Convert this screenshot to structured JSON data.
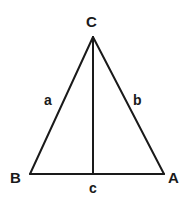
{
  "figure": {
    "type": "geometry-diagram",
    "shape": "triangle-with-altitude",
    "background_color": "#ffffff",
    "stroke_color": "#1a1a1a",
    "label_color": "#1a1a1a"
  },
  "vertices": {
    "apex": {
      "label": "C",
      "x": 93,
      "y": 37
    },
    "bottom_left": {
      "label": "B",
      "x": 30,
      "y": 174
    },
    "bottom_right": {
      "label": "A",
      "x": 164,
      "y": 174
    },
    "foot_of_altitude": {
      "x": 93,
      "y": 174
    }
  },
  "sides": {
    "left": {
      "label": "a",
      "from": "C",
      "to": "B"
    },
    "right": {
      "label": "b",
      "from": "C",
      "to": "A"
    },
    "base": {
      "label": "c",
      "from": "B",
      "to": "A"
    }
  },
  "altitude": {
    "from": "C",
    "to": "foot_of_altitude",
    "label": ""
  },
  "labels": {
    "apex_C": "C",
    "vertex_B": "B",
    "vertex_A": "A",
    "side_a": "a",
    "side_b": "b",
    "side_c": "c"
  }
}
